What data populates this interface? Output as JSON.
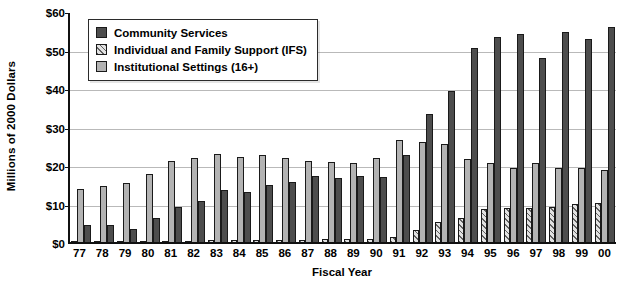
{
  "chart_data": {
    "type": "bar",
    "title": "",
    "xlabel": "Fiscal Year",
    "ylabel": "Millions of 2000 Dollars",
    "ylim": [
      0,
      60
    ],
    "ytick_labels": [
      "$0",
      "$10",
      "$20",
      "$30",
      "$40",
      "$50",
      "$60"
    ],
    "ytick_values": [
      0,
      10,
      20,
      30,
      40,
      50,
      60
    ],
    "grid": true,
    "legend_position": "upper-left-inside",
    "bar_order_in_group": [
      "Individual and Family Support (IFS)",
      "Institutional Settings (16+)",
      "Community Services"
    ],
    "categories": [
      "77",
      "78",
      "79",
      "80",
      "81",
      "82",
      "83",
      "84",
      "85",
      "86",
      "87",
      "88",
      "89",
      "90",
      "91",
      "92",
      "93",
      "94",
      "95",
      "96",
      "97",
      "98",
      "99",
      "00"
    ],
    "series": [
      {
        "name": "Individual and Family Support (IFS)",
        "color": "#e2e2e2",
        "pattern": "diagonal-hatch",
        "values": [
          0.2,
          0.2,
          0.2,
          0.2,
          0.3,
          0.3,
          0.4,
          0.4,
          0.5,
          0.5,
          0.6,
          0.7,
          0.8,
          0.9,
          1.2,
          3.0,
          5.2,
          6.2,
          8.5,
          8.8,
          8.9,
          9.2,
          9.8,
          10.2
        ]
      },
      {
        "name": "Institutional Settings (16+)",
        "color": "#b3b3b3",
        "values": [
          13.8,
          14.5,
          15.3,
          17.7,
          21.1,
          21.8,
          22.8,
          22.2,
          22.7,
          21.7,
          21.0,
          20.9,
          20.6,
          21.8,
          26.6,
          26.0,
          25.5,
          21.5,
          20.6,
          19.1,
          20.4,
          19.2,
          19.2,
          18.8
        ]
      },
      {
        "name": "Community Services",
        "color": "#4d4d4d",
        "values": [
          4.3,
          4.3,
          3.3,
          6.2,
          9.0,
          10.6,
          13.4,
          13.0,
          14.9,
          15.5,
          17.1,
          16.7,
          17.1,
          16.9,
          22.5,
          33.2,
          39.2,
          50.5,
          53.2,
          54.0,
          47.8,
          54.5,
          52.7,
          55.8
        ]
      }
    ]
  },
  "legend": {
    "items": [
      {
        "label": "Community Services",
        "key": "cs"
      },
      {
        "label": "Individual and Family Support (IFS)",
        "key": "ifs"
      },
      {
        "label": "Institutional Settings (16+)",
        "key": "inst"
      }
    ]
  }
}
